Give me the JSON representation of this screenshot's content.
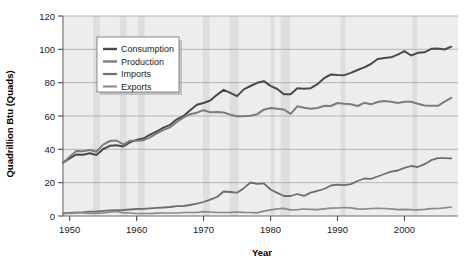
{
  "chart_data": {
    "type": "line",
    "title": "",
    "xlabel": "Year",
    "ylabel": "Quadrillion Btu (Quads)",
    "xlim": [
      1949,
      2008
    ],
    "ylim": [
      0,
      120
    ],
    "xticks": [
      1950,
      1960,
      1970,
      1980,
      1990,
      2000
    ],
    "xtick_labels": [
      "1950",
      "1960",
      "1970",
      "1980",
      "1990",
      "2000"
    ],
    "yticks": [
      0,
      20,
      40,
      60,
      80,
      100,
      120
    ],
    "ytick_labels": [
      "0",
      "20",
      "40",
      "60",
      "80",
      "100",
      "120"
    ],
    "grid": "horizontal",
    "legend_position": "top-left-inside",
    "shaded_bands": [
      {
        "start": 1953.5,
        "end": 1954.5
      },
      {
        "start": 1957.5,
        "end": 1958.5
      },
      {
        "start": 1960.2,
        "end": 1961.2
      },
      {
        "start": 1969.9,
        "end": 1970.9
      },
      {
        "start": 1973.9,
        "end": 1975.2
      },
      {
        "start": 1980.0,
        "end": 1980.6
      },
      {
        "start": 1981.5,
        "end": 1982.9
      },
      {
        "start": 1990.5,
        "end": 1991.2
      },
      {
        "start": 2001.2,
        "end": 2001.9
      }
    ],
    "x": [
      1949,
      1950,
      1951,
      1952,
      1953,
      1954,
      1955,
      1956,
      1957,
      1958,
      1959,
      1960,
      1961,
      1962,
      1963,
      1964,
      1965,
      1966,
      1967,
      1968,
      1969,
      1970,
      1971,
      1972,
      1973,
      1974,
      1975,
      1976,
      1977,
      1978,
      1979,
      1980,
      1981,
      1982,
      1983,
      1984,
      1985,
      1986,
      1987,
      1988,
      1989,
      1990,
      1991,
      1992,
      1993,
      1994,
      1995,
      1996,
      1997,
      1998,
      1999,
      2000,
      2001,
      2002,
      2003,
      2004,
      2005,
      2006,
      2007
    ],
    "series": [
      {
        "name": "Consumption",
        "color": "#4a4a4a",
        "width": 2.0,
        "values": [
          32.0,
          34.6,
          36.9,
          36.7,
          37.7,
          36.6,
          40.2,
          42.1,
          42.4,
          41.7,
          44.2,
          45.7,
          46.5,
          48.8,
          50.7,
          53.0,
          54.7,
          58.0,
          60.0,
          63.5,
          66.7,
          67.8,
          69.3,
          72.7,
          75.7,
          73.9,
          71.9,
          76.0,
          78.0,
          79.9,
          80.9,
          78.1,
          76.2,
          73.1,
          73.0,
          76.7,
          76.4,
          76.7,
          79.1,
          82.7,
          84.9,
          84.6,
          84.5,
          85.9,
          87.6,
          89.2,
          91.2,
          94.2,
          94.8,
          95.2,
          96.8,
          98.9,
          96.3,
          97.9,
          98.2,
          100.3,
          100.5,
          99.9,
          101.6
        ]
      },
      {
        "name": "Production",
        "color": "#7c7c7c",
        "width": 2.0,
        "values": [
          31.7,
          35.5,
          39.0,
          38.8,
          39.6,
          38.6,
          42.8,
          45.0,
          45.3,
          43.0,
          45.1,
          45.2,
          45.5,
          47.2,
          49.6,
          51.7,
          53.2,
          56.4,
          59.2,
          61.1,
          62.0,
          63.5,
          62.3,
          62.4,
          62.1,
          60.8,
          59.9,
          59.9,
          60.2,
          61.1,
          63.8,
          64.8,
          64.4,
          63.9,
          61.3,
          65.8,
          64.9,
          64.3,
          64.8,
          66.1,
          66.0,
          67.8,
          67.3,
          67.1,
          66.0,
          67.9,
          67.0,
          68.4,
          69.0,
          68.6,
          67.8,
          68.6,
          68.6,
          67.4,
          66.3,
          66.2,
          66.1,
          68.6,
          70.9
        ]
      },
      {
        "name": "Imports",
        "color": "#6e6e6e",
        "width": 1.8,
        "values": [
          1.4,
          1.9,
          2.2,
          2.3,
          2.6,
          2.7,
          3.1,
          3.4,
          3.5,
          3.6,
          3.9,
          4.2,
          4.3,
          4.6,
          4.9,
          5.1,
          5.4,
          5.9,
          6.0,
          6.6,
          7.4,
          8.4,
          9.8,
          11.4,
          14.7,
          14.4,
          14.0,
          16.7,
          20.1,
          19.3,
          19.6,
          15.9,
          13.9,
          12.0,
          12.0,
          13.2,
          12.1,
          14.0,
          15.1,
          16.2,
          18.3,
          18.8,
          18.5,
          19.1,
          21.0,
          22.5,
          22.3,
          23.7,
          25.2,
          26.6,
          27.3,
          28.9,
          30.0,
          29.4,
          31.1,
          33.5,
          34.7,
          34.7,
          34.6
        ]
      },
      {
        "name": "Exports",
        "color": "#8a8a8a",
        "width": 1.7,
        "values": [
          2.0,
          1.5,
          1.9,
          1.9,
          1.6,
          1.7,
          1.9,
          2.3,
          2.7,
          2.0,
          1.8,
          1.5,
          1.5,
          1.5,
          1.7,
          1.8,
          1.8,
          1.8,
          2.1,
          2.1,
          2.1,
          2.6,
          2.4,
          2.1,
          2.1,
          2.2,
          2.4,
          2.2,
          2.1,
          1.9,
          2.9,
          3.7,
          4.3,
          4.6,
          3.7,
          3.8,
          4.2,
          4.0,
          3.8,
          4.3,
          4.7,
          4.8,
          5.1,
          4.9,
          4.3,
          4.1,
          4.5,
          4.6,
          4.5,
          4.3,
          3.8,
          4.0,
          3.8,
          3.7,
          4.0,
          4.4,
          4.5,
          4.9,
          5.4
        ]
      }
    ]
  },
  "legend": {
    "items": [
      {
        "label": "Consumption"
      },
      {
        "label": "Production"
      },
      {
        "label": "Imports"
      },
      {
        "label": "Exports"
      }
    ]
  }
}
